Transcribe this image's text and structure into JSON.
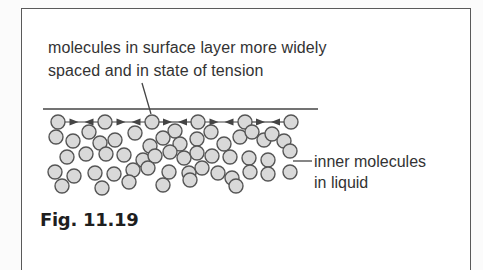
{
  "figure": {
    "label": "Fig. 11.19",
    "caption_lines": [
      "molecules in surface layer more widely",
      "spaced and in state of tension"
    ],
    "inner_label_lines": [
      "inner molecules",
      "in liquid"
    ]
  },
  "colors": {
    "molecule_fill": "#d9d9d9",
    "molecule_stroke": "#555555",
    "line": "#444444",
    "text": "#333333"
  },
  "diagram": {
    "surface_line": {
      "x1": 43,
      "y1": 109,
      "x2": 318,
      "y2": 109
    },
    "caption_pointer": {
      "x1": 142,
      "y1": 83,
      "x2": 151,
      "y2": 114
    },
    "inner_pointer": {
      "x1": 293,
      "y1": 161,
      "x2": 312,
      "y2": 161
    },
    "molecule_radius": 7,
    "surface_molecules": [
      [
        58,
        122
      ],
      [
        105,
        122
      ],
      [
        152,
        122
      ],
      [
        198,
        122
      ],
      [
        245,
        122
      ],
      [
        291,
        122
      ]
    ],
    "inner_molecules": [
      [
        56,
        137
      ],
      [
        73,
        141
      ],
      [
        89,
        132
      ],
      [
        100,
        143
      ],
      [
        115,
        140
      ],
      [
        135,
        133
      ],
      [
        150,
        146
      ],
      [
        163,
        138
      ],
      [
        175,
        131
      ],
      [
        180,
        144
      ],
      [
        197,
        139
      ],
      [
        211,
        132
      ],
      [
        224,
        144
      ],
      [
        240,
        137
      ],
      [
        252,
        132
      ],
      [
        264,
        140
      ],
      [
        272,
        134
      ],
      [
        284,
        141
      ],
      [
        67,
        157
      ],
      [
        86,
        154
      ],
      [
        106,
        154
      ],
      [
        124,
        155
      ],
      [
        143,
        160
      ],
      [
        155,
        156
      ],
      [
        170,
        152
      ],
      [
        184,
        158
      ],
      [
        197,
        153
      ],
      [
        212,
        156
      ],
      [
        230,
        157
      ],
      [
        249,
        158
      ],
      [
        268,
        160
      ],
      [
        290,
        151
      ],
      [
        55,
        172
      ],
      [
        74,
        176
      ],
      [
        95,
        173
      ],
      [
        114,
        174
      ],
      [
        133,
        170
      ],
      [
        148,
        168
      ],
      [
        169,
        172
      ],
      [
        189,
        173
      ],
      [
        202,
        168
      ],
      [
        218,
        173
      ],
      [
        232,
        178
      ],
      [
        250,
        172
      ],
      [
        268,
        174
      ],
      [
        290,
        172
      ],
      [
        62,
        186
      ],
      [
        102,
        188
      ],
      [
        129,
        182
      ],
      [
        163,
        185
      ],
      [
        190,
        180
      ],
      [
        236,
        186
      ]
    ]
  }
}
